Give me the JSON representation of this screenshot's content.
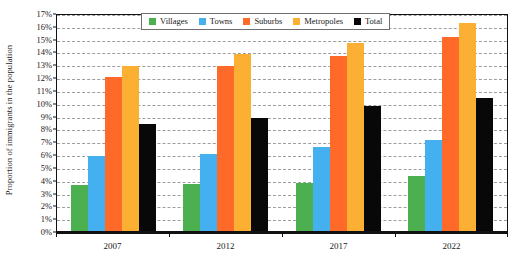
{
  "chart_data": {
    "type": "bar",
    "title": "",
    "subtitle": "",
    "xlabel": "",
    "ylabel": "Proportion of immigrants in the population",
    "categories": [
      "2007",
      "2012",
      "2017",
      "2022"
    ],
    "ylim": [
      0,
      17
    ],
    "ytick_labels": [
      "0%",
      "1%",
      "2%",
      "3%",
      "4%",
      "5%",
      "6%",
      "7%",
      "8%",
      "9%",
      "10%",
      "11%",
      "12%",
      "13%",
      "14%",
      "15%",
      "16%",
      "17%"
    ],
    "ytick_values": [
      0,
      1,
      2,
      3,
      4,
      5,
      6,
      7,
      8,
      9,
      10,
      11,
      12,
      13,
      14,
      15,
      16,
      17
    ],
    "grid": true,
    "grid_style": "dashed-horizontal",
    "legend_position": "top-center",
    "series": [
      {
        "name": "Villages",
        "color": "#4CAF50",
        "values": [
          3.6,
          3.7,
          3.8,
          4.3
        ]
      },
      {
        "name": "Towns",
        "color": "#45B0F0",
        "values": [
          5.9,
          6.1,
          6.6,
          7.2
        ]
      },
      {
        "name": "Suburbs",
        "color": "#FF6A28",
        "values": [
          12.1,
          13.0,
          13.8,
          15.3
        ]
      },
      {
        "name": "Metropoles",
        "color": "#FBB034",
        "values": [
          13.0,
          13.9,
          14.8,
          16.4
        ]
      },
      {
        "name": "Total",
        "color": "#080808",
        "values": [
          8.4,
          8.9,
          9.8,
          10.5
        ]
      }
    ]
  },
  "legend": {
    "items": [
      {
        "label": "Villages",
        "color": "#4CAF50"
      },
      {
        "label": "Towns",
        "color": "#45B0F0"
      },
      {
        "label": "Suburbs",
        "color": "#FF6A28"
      },
      {
        "label": "Metropoles",
        "color": "#FBB034"
      },
      {
        "label": "Total",
        "color": "#080808"
      }
    ]
  },
  "axes": {
    "y_title": "Proportion of immigrants in the population"
  }
}
